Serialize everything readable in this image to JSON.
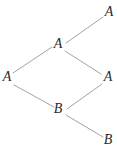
{
  "diagram": {
    "background_color": "#ffffff",
    "edge_color": "#999999",
    "label_color": "#2b2b2b",
    "nodes": [
      {
        "id": "a-top-right",
        "label": "A",
        "x": 109,
        "y": 13
      },
      {
        "id": "a-upper-middle",
        "label": "A",
        "x": 58,
        "y": 45
      },
      {
        "id": "a-left",
        "label": "A",
        "x": 7,
        "y": 78
      },
      {
        "id": "a-right",
        "label": "A",
        "x": 108,
        "y": 78
      },
      {
        "id": "b-middle",
        "label": "B",
        "x": 58,
        "y": 110
      },
      {
        "id": "b-bottom-right",
        "label": "B",
        "x": 108,
        "y": 141
      }
    ],
    "edges": [
      {
        "from": "a-left",
        "to": "a-upper-middle",
        "x1": 13,
        "y1": 73,
        "x2": 52,
        "y2": 47
      },
      {
        "from": "a-upper-middle",
        "to": "a-top-right",
        "x1": 66,
        "y1": 43,
        "x2": 103,
        "y2": 17
      },
      {
        "from": "a-upper-middle",
        "to": "a-right",
        "x1": 65,
        "y1": 51,
        "x2": 101,
        "y2": 74
      },
      {
        "from": "a-left",
        "to": "b-middle",
        "x1": 14,
        "y1": 85,
        "x2": 54,
        "y2": 107
      },
      {
        "from": "b-middle",
        "to": "a-right",
        "x1": 67,
        "y1": 109,
        "x2": 102,
        "y2": 84
      },
      {
        "from": "b-middle",
        "to": "b-bottom-right",
        "x1": 66,
        "y1": 115,
        "x2": 103,
        "y2": 137
      }
    ]
  }
}
